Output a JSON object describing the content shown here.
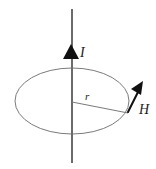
{
  "figure": {
    "kind": "physics-diagram",
    "background_color": "#ffffff"
  },
  "labels": {
    "current": "I",
    "radius": "r",
    "field": "H"
  },
  "colors": {
    "wire": "#6b6b6b",
    "arrowhead": "#111111",
    "loop": "#7a7a7a",
    "radius_line": "#7a7a7a",
    "field_arrow": "#111111",
    "text": "#1a1a1a"
  },
  "geometry": {
    "wire": {
      "x": 72,
      "y_top": 9,
      "y_bottom": 163,
      "stroke_width": 2
    },
    "current_arrowhead": {
      "apex_x": 71,
      "apex_y": 44,
      "base_y": 59,
      "half_width": 8
    },
    "loop": {
      "cx": 72,
      "cy": 101,
      "rx": 57,
      "ry": 33,
      "stroke_width": 1
    },
    "radius_line": {
      "x1": 72,
      "y1": 102,
      "x2": 128,
      "y2": 113,
      "stroke_width": 1
    },
    "field_arrow": {
      "x1": 128,
      "y1": 112,
      "x2": 143,
      "y2": 82,
      "stroke_width": 2
    },
    "label_positions": {
      "current": {
        "x": 80,
        "y": 57
      },
      "radius": {
        "x": 85,
        "y": 100
      },
      "field": {
        "x": 139,
        "y": 114
      }
    }
  }
}
